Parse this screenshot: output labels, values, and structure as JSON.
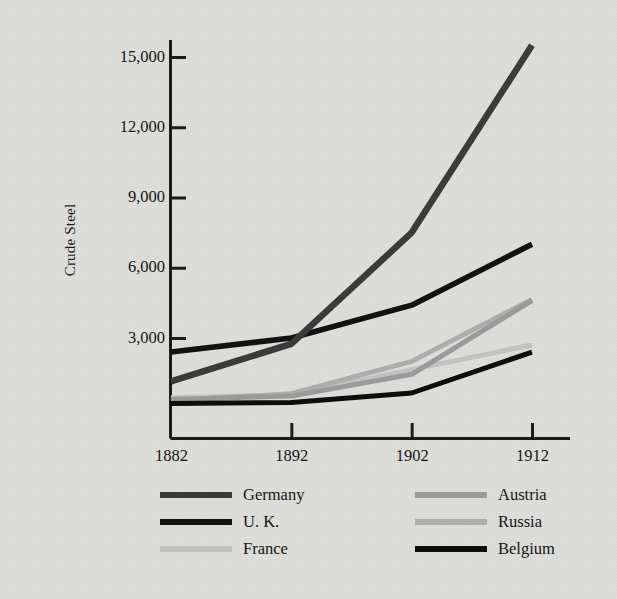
{
  "chart_data": {
    "type": "line",
    "title": "",
    "ylabel": "Crude Steel",
    "xlabel": "",
    "x": [
      1882,
      1892,
      1902,
      1912
    ],
    "categories": [
      "1882",
      "1892",
      "1902",
      "1912"
    ],
    "ylim": [
      0,
      16000
    ],
    "xlim": [
      1882,
      1912
    ],
    "yticks": [
      3000,
      6000,
      9000,
      12000,
      15000
    ],
    "ytick_labels": [
      "3,000",
      "6,000",
      "9,000",
      "12,000",
      "15,000"
    ],
    "xticks": [
      1882,
      1892,
      1902,
      1912
    ],
    "xtick_labels": [
      "1882",
      "1892",
      "1902",
      "1912"
    ],
    "grid": false,
    "legend_position": "below-plot-two-columns",
    "series": [
      {
        "name": "Germany",
        "color": "#3b3b3b",
        "width": 6.5,
        "values": [
          1150,
          2750,
          7500,
          15500
        ]
      },
      {
        "name": "U. K.",
        "color": "#121212",
        "width": 5.5,
        "values": [
          2400,
          3000,
          4400,
          7000
        ]
      },
      {
        "name": "France",
        "color": "#c2c2c2",
        "width": 5.0,
        "values": [
          450,
          580,
          1650,
          2700
        ]
      },
      {
        "name": "Austria",
        "color": "#9a9a9a",
        "width": 5.0,
        "values": [
          380,
          520,
          1450,
          4600
        ]
      },
      {
        "name": "Russia",
        "color": "#adadad",
        "width": 5.0,
        "values": [
          320,
          620,
          2000,
          4650
        ]
      },
      {
        "name": "Belgium",
        "color": "#0d0d0d",
        "width": 5.0,
        "values": [
          200,
          250,
          650,
          2400
        ]
      }
    ]
  },
  "axes": {
    "ylabel": "Crude Steel",
    "ytick_labels": [
      "3,000",
      "6,000",
      "9,000",
      "12,000",
      "15,000"
    ],
    "xtick_labels": [
      "1882",
      "1892",
      "1902",
      "1912"
    ]
  },
  "legend": {
    "left_column": [
      {
        "label": "Germany",
        "color": "#3b3b3b"
      },
      {
        "label": "U. K.",
        "color": "#121212"
      },
      {
        "label": "France",
        "color": "#c2c2c2"
      }
    ],
    "right_column": [
      {
        "label": "Austria",
        "color": "#9a9a9a"
      },
      {
        "label": "Russia",
        "color": "#adadad"
      },
      {
        "label": "Belgium",
        "color": "#0d0d0d"
      }
    ]
  },
  "colors": {
    "background": "#dcdcd8",
    "axis": "#1b1b1b",
    "text": "#151515"
  }
}
